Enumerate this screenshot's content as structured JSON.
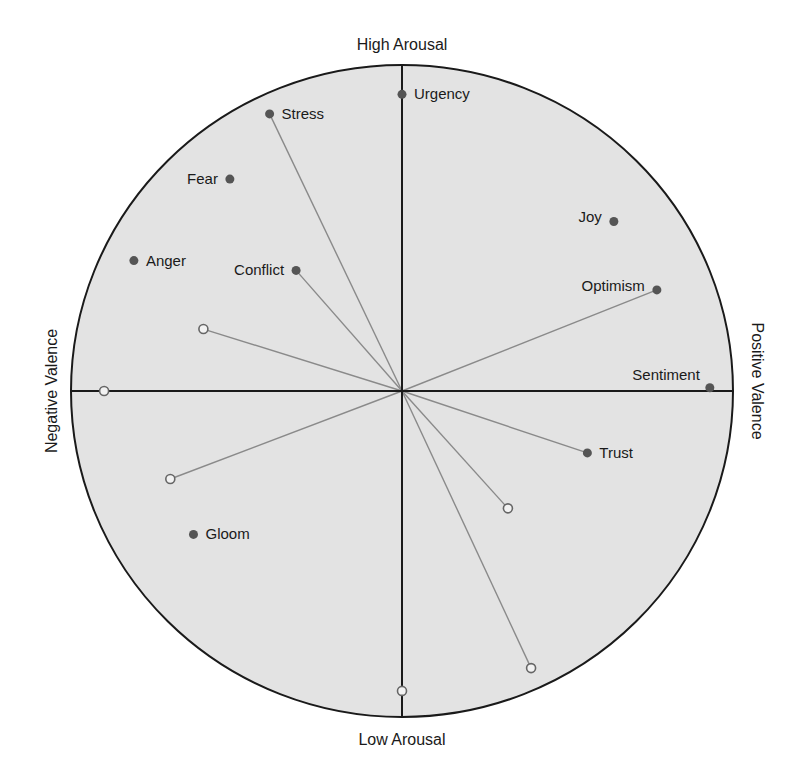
{
  "chart_data": {
    "type": "scatter",
    "subtype": "circumplex",
    "title": "",
    "axis_labels": {
      "top": "High Arousal",
      "bottom": "Low Arousal",
      "left": "Negative Valence",
      "right": "Positive Valence"
    },
    "xlabel": "Valence",
    "ylabel": "Arousal",
    "xlim": [
      -1,
      1
    ],
    "ylim": [
      -1,
      1
    ],
    "grid": false,
    "legend": null,
    "colors": {
      "circle_fill": "#e3e3e3",
      "axis": "#1a1a1a",
      "point": "#555555",
      "vector": "#8a8a8a"
    },
    "labeled_points": [
      {
        "label": "Urgency",
        "x": 0.0,
        "y": 0.91,
        "vector": false
      },
      {
        "label": "Stress",
        "x": -0.4,
        "y": 0.85,
        "vector": true
      },
      {
        "label": "Fear",
        "x": -0.52,
        "y": 0.65,
        "vector": false
      },
      {
        "label": "Joy",
        "x": 0.64,
        "y": 0.52,
        "vector": false
      },
      {
        "label": "Anger",
        "x": -0.81,
        "y": 0.4,
        "vector": false
      },
      {
        "label": "Conflict",
        "x": -0.32,
        "y": 0.37,
        "vector": true
      },
      {
        "label": "Optimism",
        "x": 0.77,
        "y": 0.31,
        "vector": true
      },
      {
        "label": "Sentiment",
        "x": 0.93,
        "y": 0.01,
        "vector": false
      },
      {
        "label": "Trust",
        "x": 0.56,
        "y": -0.19,
        "vector": true
      },
      {
        "label": "Gloom",
        "x": -0.63,
        "y": -0.44,
        "vector": false
      }
    ],
    "unlabeled_open_points": [
      {
        "x": -0.6,
        "y": 0.19,
        "vector": true
      },
      {
        "x": -0.9,
        "y": 0.0,
        "vector": false
      },
      {
        "x": -0.7,
        "y": -0.27,
        "vector": true
      },
      {
        "x": 0.32,
        "y": -0.36,
        "vector": true
      },
      {
        "x": 0.39,
        "y": -0.85,
        "vector": true
      },
      {
        "x": 0.0,
        "y": -0.92,
        "vector": false
      }
    ]
  },
  "layout": {
    "cx": 402,
    "cy": 391,
    "rx": 331,
    "ry": 326
  }
}
